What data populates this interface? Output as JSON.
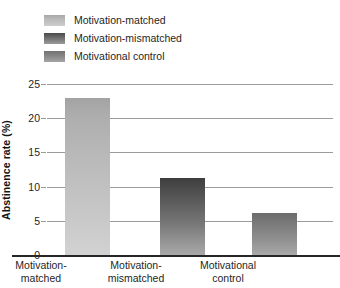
{
  "chart_data": {
    "type": "bar",
    "title": "",
    "xlabel": "",
    "ylabel": "Abstinence rate (%)",
    "categories": [
      "Motivation-matched",
      "Motivation-mismatched",
      "Motivational control"
    ],
    "values": [
      23,
      11.2,
      6.1
    ],
    "ylim": [
      0,
      25
    ],
    "yticks": [
      0,
      5,
      10,
      15,
      20,
      25
    ],
    "grid": true,
    "legend_position": "top-left",
    "legend": [
      "Motivation-matched",
      "Motivation-mismatched",
      "Motivational control"
    ],
    "colors": [
      "#bcbcbc",
      "#5a5a5a",
      "#8a8a8a"
    ]
  },
  "legend": {
    "items": [
      {
        "label": "Motivation-matched",
        "swatch": "legend-swatch-matched"
      },
      {
        "label": "Motivation-mismatched",
        "swatch": "legend-swatch-mismatched"
      },
      {
        "label": "Motivational control",
        "swatch": "legend-swatch-control"
      }
    ]
  },
  "axes": {
    "y_title": "Abstinence rate (%)",
    "y_ticks": [
      "25",
      "20",
      "15",
      "10",
      "5",
      "0"
    ],
    "x_categories": [
      {
        "line1": "Motivation-",
        "line2": "matched"
      },
      {
        "line1": "Motivation-",
        "line2": "mismatched"
      },
      {
        "line1": "Motivational",
        "line2": "control"
      }
    ]
  }
}
